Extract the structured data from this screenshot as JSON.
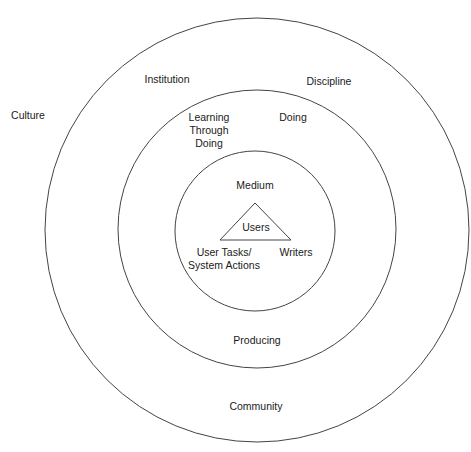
{
  "diagram": {
    "type": "concentric-circles",
    "stroke_color": "#444444",
    "circles": [
      {
        "name": "outer",
        "cx": 257,
        "cy": 230,
        "r": 212
      },
      {
        "name": "middle",
        "cx": 257,
        "cy": 229,
        "r": 139
      },
      {
        "name": "inner",
        "cx": 255,
        "cy": 231,
        "r": 80
      }
    ],
    "triangle": {
      "points": "255,203 220,240 291,240"
    },
    "labels": {
      "culture": "Culture",
      "institution": "Institution",
      "discipline": "Discipline",
      "learning_line1": "Learning",
      "learning_line2": "Through",
      "learning_line3": "Doing",
      "doing": "Doing",
      "medium": "Medium",
      "users": "Users",
      "user_tasks_line1": "User Tasks/",
      "user_tasks_line2": "System Actions",
      "writers": "Writers",
      "producing": "Producing",
      "community": "Community"
    }
  }
}
